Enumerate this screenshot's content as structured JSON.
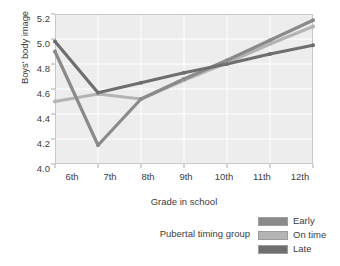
{
  "chart_data": {
    "type": "line",
    "title": "",
    "xlabel": "Grade in school",
    "ylabel": "Boys' body image",
    "categories": [
      "6th",
      "7th",
      "8th",
      "9th",
      "10th",
      "11th",
      "12th"
    ],
    "x_tick_labels": [
      "6th",
      "7th",
      "8th",
      "9th",
      "10th",
      "11th",
      "12th"
    ],
    "y_tick_labels": [
      "5.2",
      "5.0",
      "4.8",
      "4.6",
      "4.4",
      "4.2",
      "4.0"
    ],
    "ylim": [
      4.0,
      5.2
    ],
    "y_tick_step": 0.2,
    "grid": true,
    "legend_position": "bottom-right",
    "legend_title": "Pubertal timing group",
    "series": [
      {
        "name": "Early",
        "color": "#8a8a8a",
        "values": [
          4.9,
          4.15,
          4.52,
          4.68,
          4.83,
          4.99,
          5.15
        ]
      },
      {
        "name": "On time",
        "color": "#b4b4b4",
        "values": [
          4.5,
          4.56,
          4.52,
          4.67,
          4.81,
          4.96,
          5.1
        ]
      },
      {
        "name": "Late",
        "color": "#6e6e6e",
        "values": [
          4.98,
          4.57,
          4.65,
          4.73,
          4.8,
          4.88,
          4.95
        ]
      }
    ]
  },
  "axes": {
    "y_title": "Boys' body image",
    "x_title": "Grade in school",
    "y_ticks": [
      {
        "label": "5.2",
        "value": 5.2
      },
      {
        "label": "5.0",
        "value": 5.0
      },
      {
        "label": "4.8",
        "value": 4.8
      },
      {
        "label": "4.6",
        "value": 4.6
      },
      {
        "label": "4.4",
        "value": 4.4
      },
      {
        "label": "4.2",
        "value": 4.2
      },
      {
        "label": "4.0",
        "value": 4.0
      }
    ],
    "x_ticks": [
      {
        "label": "6th"
      },
      {
        "label": "7th"
      },
      {
        "label": "8th"
      },
      {
        "label": "9th"
      },
      {
        "label": "10th"
      },
      {
        "label": "11th"
      },
      {
        "label": "12th"
      }
    ]
  },
  "legend": {
    "title": "Pubertal timing group",
    "items": [
      {
        "label": "Early",
        "color": "#8a8a8a"
      },
      {
        "label": "On time",
        "color": "#b4b4b4"
      },
      {
        "label": "Late",
        "color": "#6e6e6e"
      }
    ]
  },
  "style": {
    "plot_background": "#ededed",
    "gridline_color": "#ffffff",
    "frame_color": "#c8c8c8",
    "text_color": "#3d3d3d",
    "page_background": "#ffffff"
  }
}
